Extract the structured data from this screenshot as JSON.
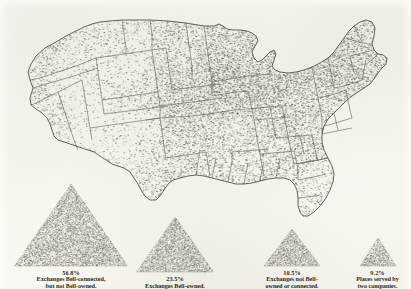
{
  "figure": {
    "kind": "dot-density-map-with-proportional-legend",
    "region": "United States",
    "background_color": "#fbfaf6",
    "ink_color": "#4a4a46",
    "dot_color": "#6b6a62",
    "triangle_fill": "#b9b7ad"
  },
  "legend": {
    "items": [
      {
        "percent": "56.8%",
        "description": "Exchanges Bell-connected,\nbut not Bell-owned.",
        "triangle_width": 113,
        "triangle_height": 82,
        "center_x": 71,
        "density": 0.568
      },
      {
        "percent": "23.5%",
        "description": "Exchanges Bell-owned.",
        "triangle_width": 77,
        "triangle_height": 55,
        "center_x": 175,
        "density": 0.235
      },
      {
        "percent": "10.5%",
        "description": "Exchanges not Bell-\nowned or connected.",
        "triangle_width": 56,
        "triangle_height": 37,
        "center_x": 292,
        "density": 0.105
      },
      {
        "percent": "9.2%",
        "description": "Places served by\ntwo companies.",
        "triangle_width": 36,
        "triangle_height": 28,
        "center_x": 385,
        "density": 0.092
      }
    ]
  },
  "chart_data": {
    "type": "map",
    "title": "",
    "subtitle": "",
    "xlabel": "",
    "ylabel": "",
    "categories": [
      "Exchanges Bell-connected, but not Bell-owned.",
      "Exchanges Bell-owned.",
      "Exchanges not Bell-owned or connected.",
      "Places served by two companies."
    ],
    "values": [
      56.8,
      23.5,
      10.5,
      9.2
    ],
    "value_labels": [
      "56.8%",
      "23.5%",
      "10.5%",
      "9.2%"
    ],
    "units": "percent",
    "legend_position": "bottom",
    "grid": false,
    "map_type": "dot-density",
    "map_region": "contiguous United States",
    "map_note": "Each dot represents a telephone exchange; density is highest in the Midwest and Northeast.",
    "state_dot_density": [
      {
        "state": "WA",
        "density": 0.42
      },
      {
        "state": "OR",
        "density": 0.3
      },
      {
        "state": "CA",
        "density": 0.32
      },
      {
        "state": "ID",
        "density": 0.2
      },
      {
        "state": "NV",
        "density": 0.07
      },
      {
        "state": "MT",
        "density": 0.22
      },
      {
        "state": "WY",
        "density": 0.16
      },
      {
        "state": "UT",
        "density": 0.14
      },
      {
        "state": "AZ",
        "density": 0.1
      },
      {
        "state": "CO",
        "density": 0.3
      },
      {
        "state": "NM",
        "density": 0.12
      },
      {
        "state": "ND",
        "density": 0.4
      },
      {
        "state": "SD",
        "density": 0.44
      },
      {
        "state": "NE",
        "density": 0.62
      },
      {
        "state": "KS",
        "density": 0.7
      },
      {
        "state": "OK",
        "density": 0.55
      },
      {
        "state": "TX",
        "density": 0.4
      },
      {
        "state": "MN",
        "density": 0.62
      },
      {
        "state": "IA",
        "density": 0.86
      },
      {
        "state": "MO",
        "density": 0.74
      },
      {
        "state": "AR",
        "density": 0.44
      },
      {
        "state": "LA",
        "density": 0.36
      },
      {
        "state": "WI",
        "density": 0.7
      },
      {
        "state": "IL",
        "density": 0.88
      },
      {
        "state": "MS",
        "density": 0.42
      },
      {
        "state": "MI",
        "density": 0.66
      },
      {
        "state": "IN",
        "density": 0.9
      },
      {
        "state": "OH",
        "density": 0.92
      },
      {
        "state": "KY",
        "density": 0.62
      },
      {
        "state": "TN",
        "density": 0.58
      },
      {
        "state": "AL",
        "density": 0.44
      },
      {
        "state": "GA",
        "density": 0.5
      },
      {
        "state": "FL",
        "density": 0.24
      },
      {
        "state": "SC",
        "density": 0.46
      },
      {
        "state": "NC",
        "density": 0.52
      },
      {
        "state": "VA",
        "density": 0.54
      },
      {
        "state": "WV",
        "density": 0.56
      },
      {
        "state": "PA",
        "density": 0.84
      },
      {
        "state": "NY",
        "density": 0.74
      },
      {
        "state": "MD",
        "density": 0.58
      },
      {
        "state": "NJ",
        "density": 0.7
      },
      {
        "state": "CT",
        "density": 0.66
      },
      {
        "state": "RI",
        "density": 0.6
      },
      {
        "state": "MA",
        "density": 0.68
      },
      {
        "state": "VT",
        "density": 0.5
      },
      {
        "state": "NH",
        "density": 0.48
      },
      {
        "state": "ME",
        "density": 0.34
      }
    ]
  }
}
